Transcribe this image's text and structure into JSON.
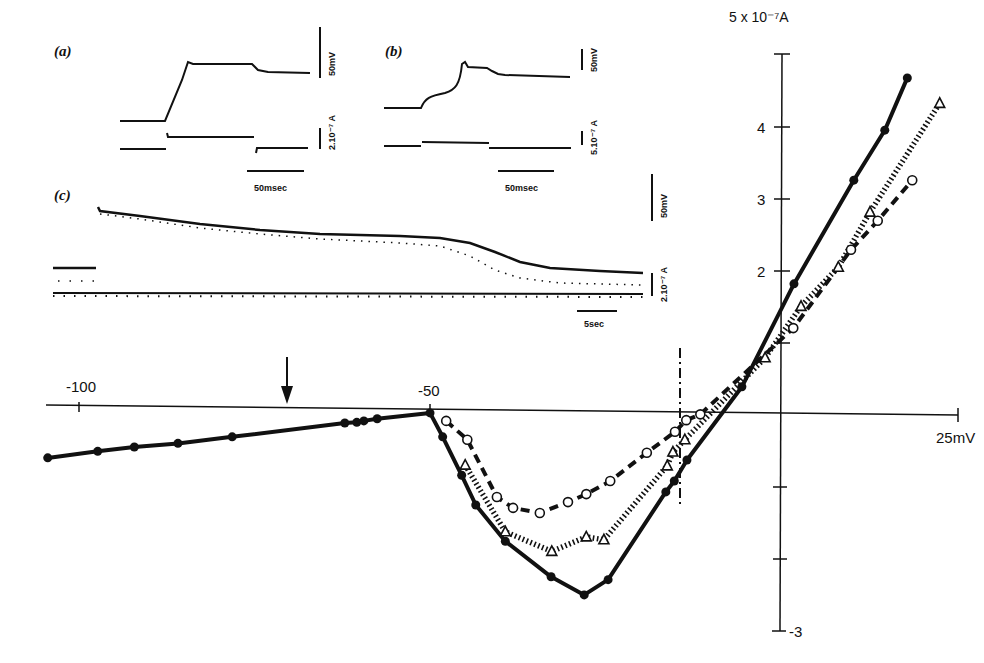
{
  "figure": {
    "panel_labels": {
      "a": "(a)",
      "b": "(b)",
      "c": "(c)"
    },
    "inset_a": {
      "scale_voltage": "50mV",
      "scale_current": "2.10⁻⁷ A",
      "scale_time": "50msec"
    },
    "inset_b": {
      "scale_voltage": "50mV",
      "scale_current": "5.10⁻⁷ A",
      "scale_time": "50msec"
    },
    "inset_c": {
      "scale_voltage": "50mV",
      "scale_current": "2.10⁻⁷ A",
      "scale_time": "5sec"
    },
    "arrow_marker": "down-arrow-icon"
  },
  "chart_data": {
    "type": "line",
    "title": "",
    "xlabel": "25mV",
    "ylabel": "5 x 10⁻⁷A",
    "x_unit": "mV",
    "y_unit": "x10^-7 A",
    "x_ticks": [
      "-100",
      "-50",
      "25mV"
    ],
    "y_ticks": [
      "5 x 10⁻⁷A",
      "4",
      "3",
      "2",
      "-3"
    ],
    "xlim": [
      -105,
      25
    ],
    "ylim": [
      -3,
      5
    ],
    "grid": false,
    "legend": "none",
    "annotations": [
      {
        "type": "arrow",
        "x": -70,
        "direction": "down"
      },
      {
        "type": "vertical-dash-dot-line",
        "x": -14
      }
    ],
    "series": [
      {
        "name": "filled circles (solid line)",
        "marker": "filled-circle",
        "line": "solid",
        "points": [
          [
            -104.3,
            -0.66
          ],
          [
            -97.2,
            -0.57
          ],
          [
            -92.0,
            -0.51
          ],
          [
            -85.8,
            -0.46
          ],
          [
            -78.1,
            -0.37
          ],
          [
            -62.1,
            -0.18
          ],
          [
            -60.4,
            -0.17
          ],
          [
            -59.4,
            -0.15
          ],
          [
            -57.5,
            -0.12
          ],
          [
            -50.0,
            -0.04
          ],
          [
            -48.2,
            -0.37
          ],
          [
            -45.5,
            -0.9
          ],
          [
            -43.5,
            -1.31
          ],
          [
            -39.3,
            -1.81
          ],
          [
            -32.8,
            -2.3
          ],
          [
            -28.1,
            -2.55
          ],
          [
            -24.7,
            -2.34
          ],
          [
            -16.5,
            -1.13
          ],
          [
            -15.3,
            -0.98
          ],
          [
            -13.5,
            -0.69
          ],
          [
            -5.7,
            0.32
          ],
          [
            1.7,
            1.74
          ],
          [
            10.2,
            3.17
          ],
          [
            14.6,
            3.86
          ],
          [
            17.8,
            4.58
          ]
        ]
      },
      {
        "name": "open circles (dashed line)",
        "marker": "open-circle",
        "line": "dashed",
        "points": [
          [
            -47.7,
            -0.15
          ],
          [
            -44.7,
            -0.41
          ],
          [
            -40.5,
            -1.2
          ],
          [
            -38.2,
            -1.35
          ],
          [
            -34.4,
            -1.42
          ],
          [
            -30.4,
            -1.27
          ],
          [
            -27.8,
            -1.16
          ],
          [
            -24.4,
            -0.98
          ],
          [
            -19.2,
            -0.59
          ],
          [
            -15.2,
            -0.3
          ],
          [
            -13.6,
            -0.14
          ],
          [
            -11.6,
            -0.06
          ],
          [
            1.6,
            1.13
          ],
          [
            9.8,
            2.21
          ],
          [
            13.6,
            2.61
          ],
          [
            18.5,
            3.17
          ]
        ]
      },
      {
        "name": "open triangles (dotted line)",
        "marker": "open-triangle",
        "line": "dotted",
        "points": [
          [
            -45.0,
            -0.76
          ],
          [
            -39.3,
            -1.68
          ],
          [
            -32.7,
            -1.95
          ],
          [
            -27.8,
            -1.75
          ],
          [
            -25.3,
            -1.79
          ],
          [
            -16.3,
            -0.77
          ],
          [
            -15.5,
            -0.58
          ],
          [
            -13.8,
            -0.41
          ],
          [
            -2.4,
            0.72
          ],
          [
            2.7,
            1.43
          ],
          [
            8.0,
            1.97
          ],
          [
            12.5,
            2.73
          ],
          [
            22.4,
            4.23
          ]
        ]
      }
    ]
  }
}
